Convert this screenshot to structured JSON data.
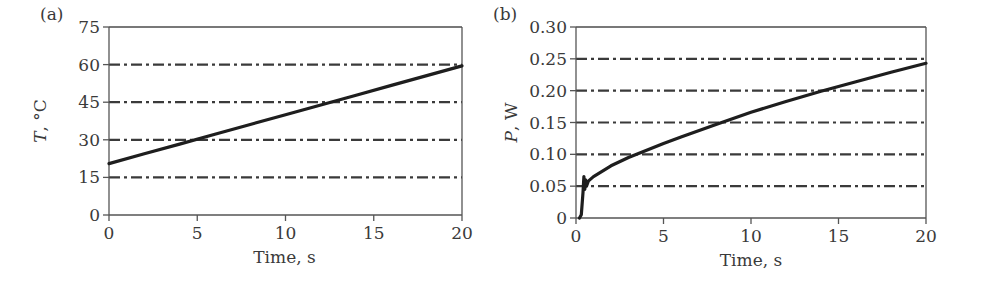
{
  "figure": {
    "panels": [
      "(a)",
      "(b)"
    ]
  },
  "chart_data": [
    {
      "type": "line",
      "panel_label": "(a)",
      "title": "",
      "xlabel": "Time, s",
      "ylabel": "T, °C",
      "ylabel_italic_part": "T",
      "ylabel_rest": ", °C",
      "xlim": [
        0,
        20
      ],
      "ylim": [
        0,
        75
      ],
      "xticks": [
        0,
        5,
        10,
        15,
        20
      ],
      "xtick_labels": [
        "0",
        "5",
        "10",
        "15",
        "20"
      ],
      "yticks": [
        0,
        15,
        30,
        45,
        60,
        75
      ],
      "ytick_labels": [
        "0",
        "15",
        "30",
        "45",
        "60",
        "75"
      ],
      "grid": "horizontal dash-dot",
      "legend": null,
      "series": [
        {
          "name": "Temperature",
          "x": [
            0,
            2,
            4,
            6,
            8,
            10,
            12,
            14,
            16,
            18,
            20
          ],
          "y": [
            20.5,
            24.4,
            28.3,
            32.2,
            36.1,
            40.0,
            43.9,
            47.8,
            51.7,
            55.6,
            59.5
          ]
        }
      ]
    },
    {
      "type": "line",
      "panel_label": "(b)",
      "title": "",
      "xlabel": "Time, s",
      "ylabel": "P, W",
      "ylabel_italic_part": "P",
      "ylabel_rest": ", W",
      "xlim": [
        0,
        20
      ],
      "ylim": [
        0,
        0.3
      ],
      "xticks": [
        0,
        5,
        10,
        15,
        20
      ],
      "xtick_labels": [
        "0",
        "5",
        "10",
        "15",
        "20"
      ],
      "yticks": [
        0,
        0.05,
        0.1,
        0.15,
        0.2,
        0.25,
        0.3
      ],
      "ytick_labels": [
        "0",
        "0.05",
        "0.10",
        "0.15",
        "0.20",
        "0.25",
        "0.30"
      ],
      "grid": "horizontal dash-dot",
      "legend": null,
      "series": [
        {
          "name": "Power",
          "x": [
            0.2,
            0.3,
            0.4,
            0.45,
            0.5,
            0.55,
            0.6,
            0.7,
            1,
            2,
            3,
            4,
            5,
            6,
            8,
            10,
            12,
            14,
            16,
            18,
            20
          ],
          "y": [
            0,
            0.005,
            0.04,
            0.065,
            0.045,
            0.06,
            0.05,
            0.058,
            0.065,
            0.082,
            0.095,
            0.106,
            0.117,
            0.127,
            0.147,
            0.166,
            0.183,
            0.199,
            0.214,
            0.229,
            0.243
          ]
        }
      ]
    }
  ]
}
